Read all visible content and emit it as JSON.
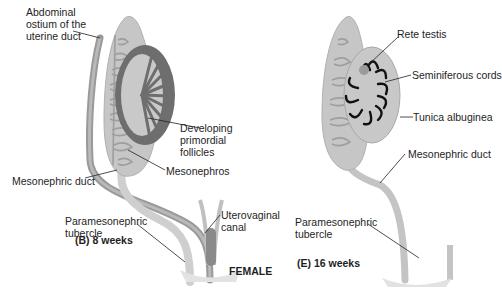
{
  "colors": {
    "tissue_light": "#c8c8c8",
    "tissue_mid": "#a9a9a9",
    "ovary_cortex": "#6e6e6e",
    "duct_dark": "#8c8c8c",
    "cords": "#111111",
    "leader": "#222222",
    "text": "#1e1e1e"
  },
  "panel_b": {
    "caption": "(B) 8 weeks",
    "labels": {
      "abdominal_ostium": [
        "Abdominal",
        "ostium of the",
        "uterine duct"
      ],
      "developing_follicles": [
        "Developing",
        "primordial",
        "follicles"
      ],
      "mesonephros": "Mesonephros",
      "mesonephric_duct": "Mesonephric duct",
      "paramesonephric_tubercle": [
        "Paramesonephric",
        "tubercle"
      ],
      "uterovaginal_canal": [
        "Uterovaginal",
        "canal"
      ]
    }
  },
  "panel_e": {
    "caption": "(E) 16 weeks",
    "labels": {
      "rete_testis": "Rete testis",
      "seminiferous_cords": "Seminiferous cords",
      "tunica_albuginea": "Tunica albuginea",
      "mesonephric_duct": "Mesonephric duct",
      "paramesonephric_tubercle": [
        "Paramesonephric",
        "tubercle"
      ]
    }
  },
  "section_label": "FEMALE"
}
